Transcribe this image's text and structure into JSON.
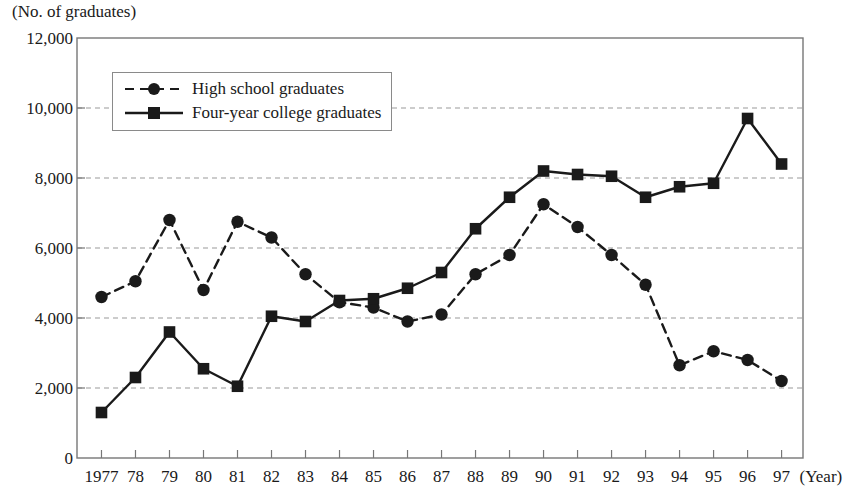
{
  "chart_data": {
    "type": "line",
    "title": "",
    "ylabel": "(No. of graduates)",
    "xlabel": "(Year)",
    "ylim": [
      0,
      12000
    ],
    "ytick_labels": [
      "0",
      "2,000",
      "4,000",
      "6,000",
      "8,000",
      "10,000",
      "12,000"
    ],
    "ytick_values": [
      0,
      2000,
      4000,
      6000,
      8000,
      10000,
      12000
    ],
    "grid": "horizontal-dashed",
    "legend_position": "upper-left",
    "categories": [
      1977,
      1978,
      1979,
      1980,
      1981,
      1982,
      1983,
      1984,
      1985,
      1986,
      1987,
      1988,
      1989,
      1990,
      1991,
      1992,
      1993,
      1994,
      1995,
      1996,
      1997
    ],
    "xtick_labels": [
      "1977",
      "78",
      "79",
      "80",
      "81",
      "82",
      "83",
      "84",
      "85",
      "86",
      "87",
      "88",
      "89",
      "90",
      "91",
      "92",
      "93",
      "94",
      "95",
      "96",
      "97"
    ],
    "series": [
      {
        "name": "High school graduates",
        "marker": "circle",
        "linestyle": "dashed",
        "color": "#1a1a1a",
        "values": [
          4600,
          5050,
          6800,
          4800,
          6750,
          6300,
          5250,
          4450,
          4300,
          3900,
          4100,
          5250,
          5800,
          7250,
          6600,
          5800,
          4950,
          2650,
          3050,
          2800,
          2200
        ]
      },
      {
        "name": "Four-year college graduates",
        "marker": "square",
        "linestyle": "solid",
        "color": "#1a1a1a",
        "values": [
          1300,
          2300,
          3600,
          2550,
          2050,
          4050,
          3900,
          4500,
          4550,
          4850,
          5300,
          6550,
          7450,
          8200,
          8100,
          8050,
          7450,
          7750,
          7850,
          9700,
          8400
        ]
      }
    ]
  },
  "legend": {
    "items": [
      {
        "label": "High school graduates"
      },
      {
        "label": "Four-year college graduates"
      }
    ]
  }
}
